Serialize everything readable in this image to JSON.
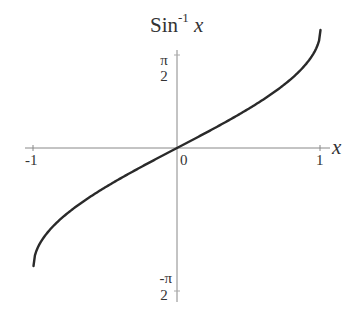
{
  "chart_data": {
    "type": "line",
    "title_main": "Sin",
    "title_sup": "-1",
    "title_var": "x",
    "xlabel": "x",
    "ylabel": "",
    "xlim": [
      -1,
      1
    ],
    "ylim": [
      -1.5708,
      1.5708
    ],
    "x_ticks": [
      "-1",
      "0",
      "1"
    ],
    "y_ticks": [
      {
        "num": "π",
        "den": "2",
        "value": 1.5708
      },
      {
        "num": "-π",
        "den": "2",
        "value": -1.5708
      }
    ],
    "grid": false,
    "legend": null,
    "series": [
      {
        "name": "arcsin(x)",
        "x": [
          -1,
          -0.9,
          -0.75,
          -0.5,
          -0.25,
          0,
          0.25,
          0.5,
          0.75,
          0.9,
          1
        ],
        "y": [
          -1.5708,
          -1.1198,
          -0.8481,
          -0.5236,
          -0.2527,
          0,
          0.2527,
          0.5236,
          0.8481,
          1.1198,
          1.5708
        ]
      }
    ],
    "colors": {
      "curve": "#2a2a2a",
      "axes": "#888888",
      "text": "#333333"
    }
  }
}
